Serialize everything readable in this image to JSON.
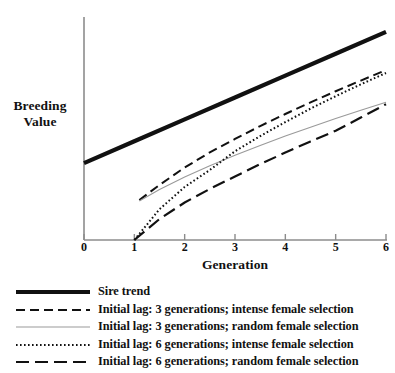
{
  "chart_data": {
    "type": "line",
    "title": "",
    "xlabel": "Generation",
    "ylabel": "Breeding Value",
    "xlim": [
      0,
      6
    ],
    "ylim": [
      0,
      10
    ],
    "xticks": [
      "0",
      "1",
      "2",
      "3",
      "4",
      "5",
      "6"
    ],
    "yticks": [],
    "grid": false,
    "legend_position": "below",
    "series": [
      {
        "name": "Sire trend",
        "style": "solid-thick",
        "x": [
          0,
          1,
          2,
          3,
          4,
          5,
          6
        ],
        "y": [
          3.45,
          4.43,
          5.41,
          6.39,
          7.37,
          8.35,
          9.33
        ]
      },
      {
        "name": "Initial lag: 3 generations; intense female selection",
        "style": "dashed",
        "x": [
          1.1,
          1.5,
          2,
          2.5,
          3,
          3.5,
          4,
          4.5,
          5,
          5.5,
          6
        ],
        "y": [
          1.79,
          2.47,
          3.25,
          3.93,
          4.53,
          5.11,
          5.65,
          6.17,
          6.67,
          7.15,
          7.62
        ]
      },
      {
        "name": "Initial lag: 3 generations; random female selection",
        "style": "solid-thin",
        "x": [
          1.1,
          1.5,
          2,
          2.5,
          3,
          3.5,
          4,
          4.5,
          5,
          5.5,
          6
        ],
        "y": [
          1.75,
          2.26,
          2.83,
          3.33,
          3.8,
          4.24,
          4.66,
          5.06,
          5.45,
          5.82,
          6.18
        ]
      },
      {
        "name": "Initial lag: 6 generations; intense female selection",
        "style": "dotted",
        "x": [
          1,
          1.5,
          2,
          2.5,
          3,
          3.5,
          4,
          4.5,
          5,
          5.5,
          6
        ],
        "y": [
          0.0,
          1.38,
          2.38,
          3.14,
          3.98,
          4.66,
          5.29,
          5.89,
          6.45,
          6.98,
          7.49
        ]
      },
      {
        "name": "Initial lag: 6 generations; random female selection",
        "style": "long-dash",
        "x": [
          1,
          1.5,
          2,
          2.5,
          3,
          3.5,
          4,
          4.5,
          5,
          5.5,
          6
        ],
        "y": [
          0.0,
          0.94,
          1.68,
          2.29,
          2.85,
          3.4,
          3.92,
          4.42,
          4.9,
          5.49,
          6.09
        ]
      }
    ]
  },
  "axes": {
    "xlabel": "Generation",
    "ylabel_line1": "Breeding",
    "ylabel_line2": "Value",
    "xticks": [
      {
        "label": "0"
      },
      {
        "label": "1"
      },
      {
        "label": "2"
      },
      {
        "label": "3"
      },
      {
        "label": "4"
      },
      {
        "label": "5"
      },
      {
        "label": "6"
      }
    ]
  },
  "legend": {
    "items": [
      {
        "label": "Sire trend",
        "style": "solid-thick"
      },
      {
        "label": "Initial lag: 3 generations; intense female selection",
        "style": "dashed"
      },
      {
        "label": "Initial lag: 3 generations; random female selection",
        "style": "solid-thin"
      },
      {
        "label": "Initial lag: 6 generations; intense female selection",
        "style": "dotted"
      },
      {
        "label": "Initial lag: 6 generations; random female selection",
        "style": "long-dash"
      }
    ]
  },
  "colors": {
    "ink": "#111111",
    "axis": "#8c8c8c",
    "thin_line": "#9a9a9a",
    "background": "#ffffff"
  }
}
